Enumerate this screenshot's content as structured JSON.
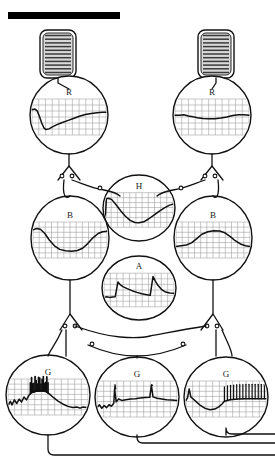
{
  "figure": {
    "background_color": "#ffffff",
    "ink_color": "#111111",
    "grid_color": "#9a9a9a",
    "trace_color": "#101010"
  },
  "scale_bar": {
    "name": "scale-bar",
    "label": "",
    "x": 8,
    "y": 12,
    "width": 112,
    "height": 7,
    "color": "#000000"
  },
  "receptors": [
    {
      "name": "stretch-receptor-left",
      "label": "",
      "cx": 58,
      "cy": 54,
      "width": 36,
      "height": 48,
      "stripe_count": 11,
      "fill": "#d8d8d8"
    },
    {
      "name": "stretch-receptor-right",
      "label": "",
      "cx": 216,
      "cy": 54,
      "width": 36,
      "height": 48,
      "stripe_count": 11,
      "fill": "#d8d8d8"
    }
  ],
  "neurons": [
    {
      "id": "R-left",
      "label": "R",
      "name": "neuron-r-left",
      "cx": 69,
      "cy": 115,
      "rx": 39,
      "ry": 39,
      "trace": {
        "name": "trace-r-left",
        "description": "sharp hyperpolarizing dip then slow ramp recovery",
        "grid_cols": 11,
        "grid_rows": 6,
        "points": [
          [
            0.0,
            0.3
          ],
          [
            0.04,
            0.28
          ],
          [
            0.07,
            0.33
          ],
          [
            0.1,
            0.48
          ],
          [
            0.13,
            0.66
          ],
          [
            0.16,
            0.8
          ],
          [
            0.19,
            0.85
          ],
          [
            0.23,
            0.83
          ],
          [
            0.27,
            0.78
          ],
          [
            0.33,
            0.72
          ],
          [
            0.4,
            0.66
          ],
          [
            0.48,
            0.6
          ],
          [
            0.56,
            0.54
          ],
          [
            0.64,
            0.48
          ],
          [
            0.72,
            0.43
          ],
          [
            0.8,
            0.4
          ],
          [
            0.88,
            0.38
          ],
          [
            0.95,
            0.37
          ],
          [
            1.0,
            0.37
          ]
        ]
      }
    },
    {
      "id": "R-right",
      "label": "R",
      "name": "neuron-r-right",
      "cx": 212,
      "cy": 115,
      "rx": 39,
      "ry": 39,
      "trace": {
        "name": "trace-r-right",
        "description": "nearly flat baseline with a shallow sustained depression",
        "grid_cols": 11,
        "grid_rows": 6,
        "points": [
          [
            0.0,
            0.45
          ],
          [
            0.06,
            0.45
          ],
          [
            0.12,
            0.44
          ],
          [
            0.18,
            0.47
          ],
          [
            0.24,
            0.49
          ],
          [
            0.3,
            0.52
          ],
          [
            0.38,
            0.54
          ],
          [
            0.46,
            0.55
          ],
          [
            0.54,
            0.55
          ],
          [
            0.62,
            0.53
          ],
          [
            0.7,
            0.5
          ],
          [
            0.78,
            0.46
          ],
          [
            0.86,
            0.44
          ],
          [
            0.93,
            0.44
          ],
          [
            1.0,
            0.45
          ]
        ]
      }
    },
    {
      "id": "H",
      "label": "H",
      "name": "neuron-h",
      "cx": 139,
      "cy": 208,
      "rx": 36,
      "ry": 33,
      "trace": {
        "name": "trace-h",
        "description": "step onset, deep trough, then slow ramp back up",
        "grid_cols": 11,
        "grid_rows": 7,
        "points": [
          [
            0.0,
            0.9
          ],
          [
            0.02,
            0.18
          ],
          [
            0.05,
            0.16
          ],
          [
            0.1,
            0.2
          ],
          [
            0.16,
            0.34
          ],
          [
            0.23,
            0.52
          ],
          [
            0.3,
            0.68
          ],
          [
            0.37,
            0.8
          ],
          [
            0.44,
            0.86
          ],
          [
            0.5,
            0.87
          ],
          [
            0.57,
            0.84
          ],
          [
            0.64,
            0.76
          ],
          [
            0.72,
            0.65
          ],
          [
            0.8,
            0.53
          ],
          [
            0.88,
            0.43
          ],
          [
            0.95,
            0.36
          ],
          [
            1.0,
            0.33
          ]
        ]
      }
    },
    {
      "id": "B-left",
      "label": "B",
      "name": "neuron-b-left",
      "cx": 70,
      "cy": 238,
      "rx": 39,
      "ry": 42,
      "trace": {
        "name": "trace-b-left",
        "description": "smooth broad U-shaped hyperpolarization",
        "grid_cols": 12,
        "grid_rows": 7,
        "points": [
          [
            0.0,
            0.22
          ],
          [
            0.05,
            0.18
          ],
          [
            0.1,
            0.2
          ],
          [
            0.16,
            0.32
          ],
          [
            0.22,
            0.5
          ],
          [
            0.29,
            0.66
          ],
          [
            0.36,
            0.76
          ],
          [
            0.44,
            0.8
          ],
          [
            0.52,
            0.81
          ],
          [
            0.6,
            0.79
          ],
          [
            0.67,
            0.73
          ],
          [
            0.74,
            0.6
          ],
          [
            0.81,
            0.44
          ],
          [
            0.88,
            0.32
          ],
          [
            0.94,
            0.27
          ],
          [
            1.0,
            0.26
          ]
        ]
      }
    },
    {
      "id": "B-right",
      "label": "B",
      "name": "neuron-b-right",
      "cx": 213,
      "cy": 238,
      "rx": 39,
      "ry": 42,
      "trace": {
        "name": "trace-b-right",
        "description": "smooth broad depolarizing hump",
        "grid_cols": 12,
        "grid_rows": 7,
        "points": [
          [
            0.0,
            0.68
          ],
          [
            0.07,
            0.66
          ],
          [
            0.14,
            0.64
          ],
          [
            0.21,
            0.58
          ],
          [
            0.28,
            0.46
          ],
          [
            0.35,
            0.34
          ],
          [
            0.43,
            0.27
          ],
          [
            0.51,
            0.24
          ],
          [
            0.59,
            0.25
          ],
          [
            0.66,
            0.3
          ],
          [
            0.73,
            0.4
          ],
          [
            0.8,
            0.52
          ],
          [
            0.87,
            0.61
          ],
          [
            0.94,
            0.66
          ],
          [
            1.0,
            0.68
          ]
        ]
      }
    },
    {
      "id": "A",
      "label": "A",
      "name": "neuron-a",
      "cx": 139,
      "cy": 288,
      "rx": 37,
      "ry": 32,
      "trace": {
        "name": "trace-a",
        "description": "two sawtooth depolarizations with slow decay between fast rises",
        "grid_cols": 11,
        "grid_rows": 6,
        "points": [
          [
            0.0,
            0.72
          ],
          [
            0.04,
            0.7
          ],
          [
            0.08,
            0.72
          ],
          [
            0.12,
            0.71
          ],
          [
            0.16,
            0.7
          ],
          [
            0.2,
            0.26
          ],
          [
            0.23,
            0.34
          ],
          [
            0.27,
            0.4
          ],
          [
            0.33,
            0.46
          ],
          [
            0.4,
            0.52
          ],
          [
            0.47,
            0.57
          ],
          [
            0.54,
            0.61
          ],
          [
            0.61,
            0.64
          ],
          [
            0.66,
            0.66
          ],
          [
            0.7,
            0.1
          ],
          [
            0.73,
            0.22
          ],
          [
            0.77,
            0.36
          ],
          [
            0.82,
            0.48
          ],
          [
            0.88,
            0.56
          ],
          [
            0.94,
            0.59
          ],
          [
            1.0,
            0.6
          ]
        ]
      }
    },
    {
      "id": "G-left",
      "label": "G",
      "name": "neuron-g-left",
      "cx": 48,
      "cy": 395,
      "rx": 42,
      "ry": 40,
      "trace": {
        "name": "trace-g-left",
        "description": "noisy baseline building to a dense high-frequency spike burst, then decline",
        "grid_cols": 12,
        "grid_rows": 7,
        "spike_burst": {
          "start": 0.28,
          "end": 0.5,
          "count": 16,
          "height": 0.42
        },
        "points": [
          [
            0.0,
            0.74
          ],
          [
            0.03,
            0.62
          ],
          [
            0.05,
            0.72
          ],
          [
            0.08,
            0.58
          ],
          [
            0.11,
            0.68
          ],
          [
            0.14,
            0.56
          ],
          [
            0.17,
            0.64
          ],
          [
            0.2,
            0.5
          ],
          [
            0.23,
            0.58
          ],
          [
            0.26,
            0.46
          ],
          [
            0.29,
            0.38
          ],
          [
            0.35,
            0.34
          ],
          [
            0.42,
            0.33
          ],
          [
            0.48,
            0.35
          ],
          [
            0.52,
            0.42
          ],
          [
            0.57,
            0.52
          ],
          [
            0.63,
            0.62
          ],
          [
            0.69,
            0.7
          ],
          [
            0.75,
            0.76
          ],
          [
            0.81,
            0.79
          ],
          [
            0.86,
            0.78
          ],
          [
            0.9,
            0.81
          ],
          [
            0.94,
            0.78
          ],
          [
            1.0,
            0.8
          ]
        ]
      }
    },
    {
      "id": "G-middle",
      "label": "G",
      "name": "neuron-g-middle",
      "cx": 137,
      "cy": 397,
      "rx": 42,
      "ry": 40,
      "trace": {
        "name": "trace-g-middle",
        "description": "low noisy baseline with two isolated tall spikes and slow upward drift",
        "grid_cols": 12,
        "grid_rows": 7,
        "spikes": [
          0.22,
          0.68
        ],
        "points": [
          [
            0.0,
            0.74
          ],
          [
            0.03,
            0.66
          ],
          [
            0.06,
            0.76
          ],
          [
            0.09,
            0.68
          ],
          [
            0.12,
            0.74
          ],
          [
            0.15,
            0.66
          ],
          [
            0.18,
            0.7
          ],
          [
            0.21,
            0.62
          ],
          [
            0.22,
            0.22
          ],
          [
            0.24,
            0.58
          ],
          [
            0.27,
            0.5
          ],
          [
            0.31,
            0.54
          ],
          [
            0.36,
            0.52
          ],
          [
            0.42,
            0.5
          ],
          [
            0.48,
            0.49
          ],
          [
            0.54,
            0.47
          ],
          [
            0.6,
            0.46
          ],
          [
            0.66,
            0.45
          ],
          [
            0.68,
            0.12
          ],
          [
            0.7,
            0.44
          ],
          [
            0.75,
            0.48
          ],
          [
            0.81,
            0.5
          ],
          [
            0.87,
            0.52
          ],
          [
            0.93,
            0.53
          ],
          [
            1.0,
            0.54
          ]
        ]
      }
    },
    {
      "id": "G-right",
      "label": "G",
      "name": "neuron-g-right",
      "cx": 226,
      "cy": 397,
      "rx": 42,
      "ry": 40,
      "trace": {
        "name": "trace-g-right",
        "description": "initial spike, deep trough, then a sustained regular train of spikes",
        "grid_cols": 12,
        "grid_rows": 7,
        "spike_train": {
          "start": 0.48,
          "end": 0.98,
          "count": 14,
          "height": 0.4
        },
        "points": [
          [
            0.0,
            0.54
          ],
          [
            0.02,
            0.46
          ],
          [
            0.04,
            0.22
          ],
          [
            0.06,
            0.44
          ],
          [
            0.09,
            0.5
          ],
          [
            0.13,
            0.58
          ],
          [
            0.18,
            0.68
          ],
          [
            0.24,
            0.76
          ],
          [
            0.3,
            0.8
          ],
          [
            0.36,
            0.78
          ],
          [
            0.41,
            0.72
          ],
          [
            0.45,
            0.64
          ],
          [
            0.48,
            0.56
          ],
          [
            0.55,
            0.52
          ],
          [
            0.65,
            0.5
          ],
          [
            0.75,
            0.49
          ],
          [
            0.85,
            0.49
          ],
          [
            0.95,
            0.49
          ],
          [
            1.0,
            0.49
          ]
        ]
      }
    }
  ],
  "synapses": [
    {
      "name": "synapse-r-left-out",
      "x": 69,
      "y": 168
    },
    {
      "name": "synapse-r-right-out",
      "x": 212,
      "y": 168
    },
    {
      "name": "synapse-b-left-out",
      "x": 70,
      "y": 318
    },
    {
      "name": "synapse-b-right-out",
      "x": 213,
      "y": 318
    },
    {
      "name": "synapse-h-left",
      "x": 98,
      "y": 186
    },
    {
      "name": "synapse-h-right",
      "x": 184,
      "y": 186
    },
    {
      "name": "synapse-a-left",
      "x": 100,
      "y": 338
    },
    {
      "name": "synapse-a-right",
      "x": 182,
      "y": 338
    }
  ],
  "output_lines": [
    {
      "name": "output-line-g-left",
      "from_x": 48,
      "down_to": 455,
      "to_x": 275
    },
    {
      "name": "output-line-g-middle",
      "from_x": 137,
      "down_to": 443,
      "to_x": 275
    },
    {
      "name": "output-line-g-right",
      "from_x": 226,
      "down_to": 434,
      "to_x": 275
    }
  ]
}
